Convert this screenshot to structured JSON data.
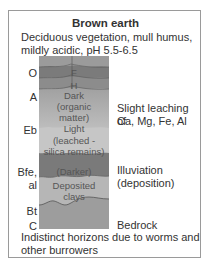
{
  "title": "Brown earth",
  "description": "Deciduous vegetation, mull humus, mildly acidic, pH 5.5-6.5",
  "horizons": [
    {
      "label": "O",
      "inner": [
        "F",
        "H"
      ]
    },
    {
      "label": "A",
      "inner": "Dark (organic matter)"
    },
    {
      "label": "Eb",
      "inner": "Light (leached - silica remains)"
    },
    {
      "label": "Bfe, al",
      "inner": "(Darker)"
    },
    {
      "label": "Bt",
      "inner": "Deposited clays"
    },
    {
      "label": "C",
      "inner": ""
    }
  ],
  "labels": {
    "o": "O",
    "a": "A",
    "eb": "Eb",
    "bfe": "Bfe,",
    "al": "al",
    "bt": "Bt",
    "c": "C"
  },
  "inner_text": {
    "f": "F",
    "h": "H",
    "a1": "Dark",
    "a2": "(organic",
    "a3": "matter)",
    "e1": "Light",
    "e2": "(leached -",
    "e3": "silica remains)",
    "b": "(Darker)",
    "bt1": "Deposited",
    "bt2": "clays"
  },
  "notes": {
    "leach1": "Slight leaching of",
    "leach2": "Ca, Mg, Fe, Al",
    "illu1": "Illuviation",
    "illu2": "(deposition)",
    "bedrock": "Bedrock"
  },
  "footer": "Indistinct horizons due to worms and other burrowers",
  "colors": {
    "litter": "#9a9a9a",
    "f_layer": "#7d7d7d",
    "h_layer": "#8c8c8c",
    "a_top": "#8e8e8e",
    "eb": "#c4c4c4",
    "bfe": "#7a7a7a",
    "bt": "#b4b4b4",
    "c": "#9d9d9d"
  }
}
